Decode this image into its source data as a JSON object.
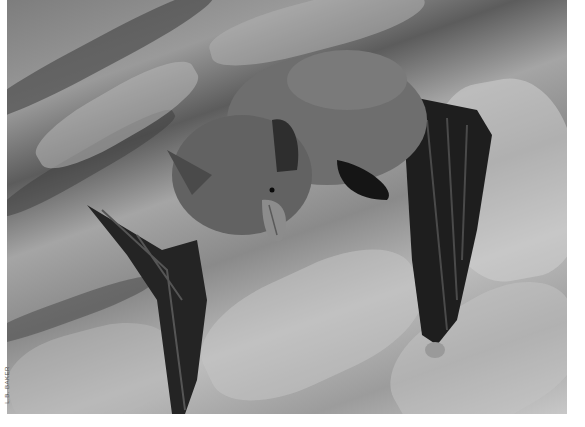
{
  "photo": {
    "subject": "bat clinging to tree bark",
    "alt": "Grayscale photograph of a furry bat with dark membranous wings folded, clinging to rough tree bark",
    "tones": {
      "bark_light": "#c8c8c8",
      "bark_mid": "#8a8a8a",
      "bark_dark": "#3a3a3a",
      "fur": "#6e6e6e",
      "wing": "#1e1e1e",
      "border": "#ffffff"
    }
  },
  "credit": {
    "text": "L.B. BAKER"
  }
}
